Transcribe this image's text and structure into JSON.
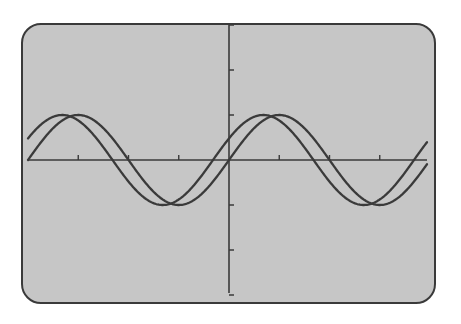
{
  "screen": {
    "background": "#c6c6c6",
    "border_color": "#3a3a3a",
    "line_color": "#3a3a3a"
  },
  "chart_data": {
    "type": "line",
    "title": "",
    "xlabel": "",
    "ylabel": "",
    "xlim": [
      -6.2832,
      6.2832
    ],
    "ylim": [
      -3,
      3
    ],
    "x_tick_step": 1.5708,
    "y_tick_step": 1,
    "grid": false,
    "legend": null,
    "series": [
      {
        "name": "y = sin(x)",
        "function": "sin(x)",
        "phase": 0,
        "amplitude": 1,
        "color": "#3a3a3a"
      },
      {
        "name": "y = sin(x + 0.5)",
        "function": "sin(x+0.5)",
        "phase": 0.5,
        "amplitude": 1,
        "color": "#3a3a3a"
      }
    ]
  }
}
